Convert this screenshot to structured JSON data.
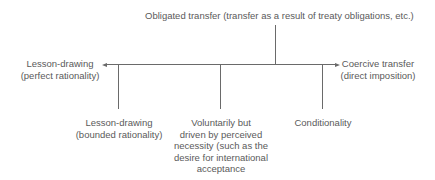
{
  "diagram": {
    "title_node": {
      "label": "Obligated transfer (transfer as a result of treaty obligations, etc.)"
    },
    "axis": {
      "left_end": {
        "lines": [
          "Lesson-drawing",
          "(perfect rationality)"
        ]
      },
      "right_end": {
        "lines": [
          "Coercive transfer",
          "(direct imposition)"
        ]
      }
    },
    "branches": [
      {
        "lines": [
          "Lesson-drawing",
          "(bounded rationality)"
        ]
      },
      {
        "lines": [
          "Voluntarily but",
          "driven by perceived",
          "necessity (such as the",
          "desire for international",
          "acceptance"
        ]
      },
      {
        "lines": [
          "Conditionality"
        ]
      }
    ],
    "colors": {
      "line": "#6a6a6a",
      "text": "#5a5a5a",
      "background": "#ffffff"
    }
  }
}
